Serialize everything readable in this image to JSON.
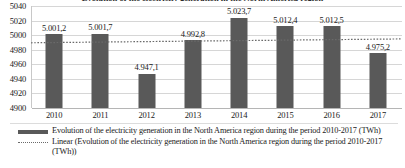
{
  "chart_data": {
    "type": "bar",
    "title": "Evolution of the electricity generation in the North America region",
    "xlabel": "",
    "ylabel": "",
    "categories": [
      "2010",
      "2011",
      "2012",
      "2013",
      "2014",
      "2015",
      "2016",
      "2017"
    ],
    "values": [
      5001.2,
      5001.7,
      4947.1,
      4992.8,
      5023.7,
      5012.4,
      5012.5,
      4975.2
    ],
    "value_labels": [
      "5.001,2",
      "5.001,7",
      "4.947,1",
      "4.992,8",
      "5.023,7",
      "5.012,4",
      "5.012,5",
      "4.975,2"
    ],
    "ylim": [
      4900,
      5040
    ],
    "yticks": [
      4900,
      4920,
      4940,
      4960,
      4980,
      5000,
      5020,
      5040
    ],
    "ytick_labels": [
      "4900",
      "4920",
      "4940",
      "4960",
      "4980",
      "5000",
      "5020",
      "5040"
    ],
    "grid": true,
    "legend_position": "bottom",
    "series": [
      {
        "name": "Evolution of the electricity generation in the North America region during the period 2010-2017 (TWh)",
        "type": "bar",
        "color": "#595959",
        "values": [
          5001.2,
          5001.7,
          4947.1,
          4992.8,
          5023.7,
          5012.4,
          5012.5,
          4975.2
        ]
      },
      {
        "name": "Linear (Evolution of the electricity generation in the North America region during the period 2010-2017 (TWh))",
        "type": "trendline",
        "style": "dotted",
        "color": "#6a6a6a",
        "start_value": 4989.5,
        "end_value": 4994.8
      }
    ],
    "units": "TWh"
  },
  "legend": {
    "items": [
      {
        "key": "bar-swatch",
        "label": "Evolution of the electricity generation in the North America region during the period 2010-2017 (TWh)"
      },
      {
        "key": "dotted-line-swatch",
        "label": "Linear (Evolution of the electricity generation in the North America region during the period 2010-2017 (TWh))"
      }
    ]
  }
}
